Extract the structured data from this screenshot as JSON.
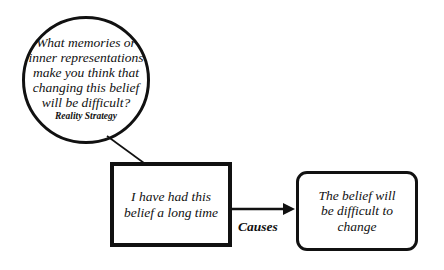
{
  "diagram": {
    "question_node": {
      "lines": [
        "What memories or",
        "inner representations",
        "make you think that",
        "changing this belief",
        "will be difficult?"
      ],
      "label": "Reality Strategy"
    },
    "cause_node": {
      "lines": [
        "I have had this",
        "belief a long time"
      ]
    },
    "effect_node": {
      "lines": [
        "The belief will",
        "be difficult to",
        "change"
      ]
    },
    "edge": {
      "label": "Causes",
      "from": "cause_node",
      "to": "effect_node"
    },
    "colors": {
      "stroke": "#111111",
      "background": "#ffffff"
    }
  }
}
